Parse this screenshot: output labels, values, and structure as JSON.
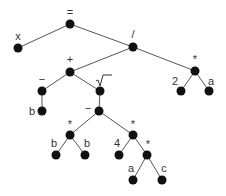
{
  "diagram": {
    "expression": "x = (-b + sqrt(b*b - 4*a*c)) / (2*a)",
    "colors": {
      "edge": "#555555",
      "node": "#111111",
      "label": "#333333",
      "background": "#ffffff"
    },
    "nodes": [
      {
        "id": "eq",
        "label": "=",
        "x": 70,
        "y": 24,
        "lx": 70,
        "ly": 16
      },
      {
        "id": "x",
        "label": "x",
        "x": 18,
        "y": 48,
        "lx": 18,
        "ly": 40
      },
      {
        "id": "div",
        "label": "/",
        "x": 133,
        "y": 47,
        "lx": 133,
        "ly": 38
      },
      {
        "id": "plus",
        "label": "+",
        "x": 70,
        "y": 72,
        "lx": 70,
        "ly": 63
      },
      {
        "id": "mul2a",
        "label": "*",
        "x": 195,
        "y": 71,
        "lx": 195,
        "ly": 63
      },
      {
        "id": "neg",
        "label": "−",
        "x": 42,
        "y": 91,
        "lx": 42,
        "ly": 83
      },
      {
        "id": "sqrt",
        "label": "√‾",
        "x": 100,
        "y": 91,
        "lx": 102,
        "ly": 82
      },
      {
        "id": "two",
        "label": "2",
        "x": 181,
        "y": 91,
        "lx": 175,
        "ly": 85
      },
      {
        "id": "a1",
        "label": "a",
        "x": 209,
        "y": 91,
        "lx": 211,
        "ly": 85
      },
      {
        "id": "b1",
        "label": "b",
        "x": 42,
        "y": 111,
        "lx": 32,
        "ly": 115
      },
      {
        "id": "minus",
        "label": "−",
        "x": 99,
        "y": 111,
        "lx": 88,
        "ly": 112
      },
      {
        "id": "mulbb",
        "label": "*",
        "x": 70,
        "y": 135,
        "lx": 70,
        "ly": 128
      },
      {
        "id": "mul4ac",
        "label": "*",
        "x": 133,
        "y": 135,
        "lx": 133,
        "ly": 128
      },
      {
        "id": "b2",
        "label": "b",
        "x": 56,
        "y": 155,
        "lx": 54,
        "ly": 147
      },
      {
        "id": "b3",
        "label": "b",
        "x": 85,
        "y": 155,
        "lx": 87,
        "ly": 147
      },
      {
        "id": "four",
        "label": "4",
        "x": 119,
        "y": 155,
        "lx": 117,
        "ly": 147
      },
      {
        "id": "mulac",
        "label": "*",
        "x": 147,
        "y": 155,
        "lx": 148,
        "ly": 148
      },
      {
        "id": "a2",
        "label": "a",
        "x": 133,
        "y": 180,
        "lx": 131,
        "ly": 172
      },
      {
        "id": "c",
        "label": "c",
        "x": 162,
        "y": 180,
        "lx": 164,
        "ly": 172
      }
    ],
    "edges": [
      [
        "eq",
        "x"
      ],
      [
        "eq",
        "div"
      ],
      [
        "div",
        "plus"
      ],
      [
        "div",
        "mul2a"
      ],
      [
        "plus",
        "neg"
      ],
      [
        "plus",
        "sqrt"
      ],
      [
        "neg",
        "b1"
      ],
      [
        "sqrt",
        "minus"
      ],
      [
        "minus",
        "mulbb"
      ],
      [
        "minus",
        "mul4ac"
      ],
      [
        "mulbb",
        "b2"
      ],
      [
        "mulbb",
        "b3"
      ],
      [
        "mul4ac",
        "four"
      ],
      [
        "mul4ac",
        "mulac"
      ],
      [
        "mulac",
        "a2"
      ],
      [
        "mulac",
        "c"
      ],
      [
        "mul2a",
        "two"
      ],
      [
        "mul2a",
        "a1"
      ]
    ]
  }
}
